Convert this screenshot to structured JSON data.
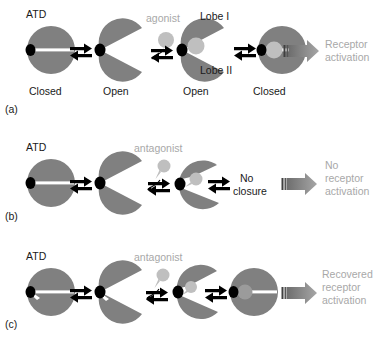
{
  "figure": {
    "body_color": "#808080",
    "hinge_color": "#000000",
    "cleft_color": "#ffffff",
    "ligand_color": "#bfbfbf",
    "gray_text_color": "#a8a8a8",
    "text_color": "#1a1a1a",
    "arrow_block_dark": "#4d4d4d",
    "arrow_block_light": "#9a9a9a"
  },
  "rows": [
    {
      "tag": "(a)",
      "atd_label": "ATD",
      "ligand_label": "agonist",
      "lobe_i_label": "Lobe I",
      "lobe_ii_label": "Lobe II",
      "state_labels": [
        "Closed",
        "Open",
        "Open",
        "Closed"
      ],
      "outcome_lines": [
        "Receptor",
        "activation"
      ]
    },
    {
      "tag": "(b)",
      "atd_label": "ATD",
      "ligand_label": "antagonist",
      "result_lines": [
        "No",
        "closure"
      ],
      "outcome_lines": [
        "No",
        "receptor",
        "activation"
      ]
    },
    {
      "tag": "(c)",
      "atd_label": "ATD",
      "ligand_label": "antagonist",
      "outcome_lines": [
        "Recovered",
        "receptor",
        "activation"
      ]
    }
  ]
}
